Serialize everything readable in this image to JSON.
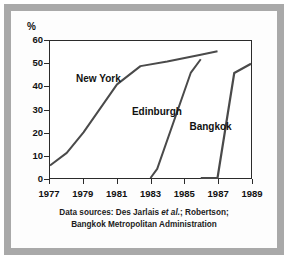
{
  "figure": {
    "y_axis_unit_label": "%",
    "caption_line1_prefix": "Data sources: Des Jarlais ",
    "caption_line1_italic": "et al.",
    "caption_line1_suffix": "; Robertson;",
    "caption_line2": "Bangkok Metropolitan Administration",
    "colors": {
      "mount_border": "#a9a9a9",
      "axis": "#2b2b2b",
      "line": "#4a4a4a",
      "background": "#ffffff",
      "text": "#111111"
    }
  },
  "chart_data": {
    "type": "line",
    "title": "",
    "subtitle": "",
    "xlabel": "",
    "ylabel": "%",
    "xlim": [
      1977,
      1989
    ],
    "ylim": [
      0,
      60
    ],
    "yticks": [
      0,
      10,
      20,
      30,
      40,
      50,
      60
    ],
    "ytick_labels": [
      "0",
      "10",
      "20",
      "30",
      "40",
      "50",
      "60"
    ],
    "xticks": [
      1977,
      1979,
      1981,
      1983,
      1985,
      1987,
      1989
    ],
    "xtick_labels": [
      "1977",
      "1979",
      "1981",
      "1983",
      "1985",
      "1987",
      "1989"
    ],
    "grid": false,
    "legend": "inline-labels",
    "series": [
      {
        "name": "New York",
        "label_x": 1978.6,
        "label_y": 43,
        "x": [
          1977,
          1978,
          1979,
          1981,
          1982.4,
          1984,
          1986,
          1987
        ],
        "y": [
          5.5,
          11,
          20,
          41,
          49,
          51,
          54,
          55.5
        ]
      },
      {
        "name": "Edinburgh",
        "label_x": 1981.9,
        "label_y": 29,
        "x": [
          1983,
          1983.4,
          1985.4,
          1986
        ],
        "y": [
          0,
          4,
          46,
          52
        ]
      },
      {
        "name": "Bangkok",
        "label_x": 1985.3,
        "label_y": 22.5,
        "x": [
          1986,
          1987,
          1988,
          1989
        ],
        "y": [
          0,
          0,
          46,
          50
        ]
      }
    ]
  }
}
